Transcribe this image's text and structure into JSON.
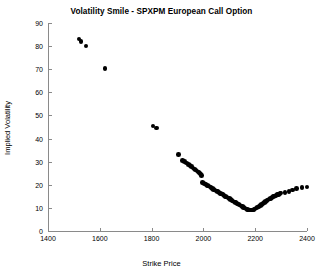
{
  "chart_data": {
    "type": "scatter",
    "title": "Volatility Smile - SPXPM European Call Option",
    "xlabel": "Strike Price",
    "ylabel": "Implied Volatility",
    "xlim": [
      1400,
      2400
    ],
    "ylim": [
      0,
      90
    ],
    "xticks": [
      1400,
      1600,
      1800,
      2000,
      2200,
      2400
    ],
    "yticks": [
      0,
      10,
      20,
      30,
      40,
      50,
      60,
      70,
      80,
      90
    ],
    "grid": false,
    "legend": null,
    "marker": {
      "shape": "circle",
      "color": "#000000",
      "size": 4.6,
      "filled": true
    },
    "series": [
      {
        "name": "Implied Volatility",
        "points": [
          [
            1520,
            83.0
          ],
          [
            1528,
            82.0
          ],
          [
            1547,
            80.0
          ],
          [
            1620,
            70.2
          ],
          [
            1805,
            45.4
          ],
          [
            1818,
            44.6
          ],
          [
            1905,
            33.0
          ],
          [
            1920,
            30.6
          ],
          [
            1928,
            30.0
          ],
          [
            1935,
            29.4
          ],
          [
            1942,
            28.8
          ],
          [
            1948,
            28.3
          ],
          [
            1954,
            27.8
          ],
          [
            1960,
            27.3
          ],
          [
            1965,
            26.9
          ],
          [
            1970,
            26.4
          ],
          [
            1975,
            26.0
          ],
          [
            1979,
            25.6
          ],
          [
            1983,
            25.2
          ],
          [
            1987,
            24.8
          ],
          [
            1990,
            24.4
          ],
          [
            1993,
            24.1
          ],
          [
            1996,
            21.0
          ],
          [
            2000,
            20.7
          ],
          [
            2005,
            20.4
          ],
          [
            2010,
            20.1
          ],
          [
            2015,
            19.7
          ],
          [
            2020,
            19.4
          ],
          [
            2025,
            19.0
          ],
          [
            2030,
            18.7
          ],
          [
            2035,
            18.3
          ],
          [
            2040,
            18.0
          ],
          [
            2045,
            17.7
          ],
          [
            2050,
            17.3
          ],
          [
            2055,
            17.0
          ],
          [
            2060,
            16.7
          ],
          [
            2065,
            16.3
          ],
          [
            2070,
            16.0
          ],
          [
            2075,
            15.7
          ],
          [
            2080,
            15.3
          ],
          [
            2085,
            15.0
          ],
          [
            2090,
            14.7
          ],
          [
            2095,
            14.3
          ],
          [
            2100,
            14.0
          ],
          [
            2105,
            13.7
          ],
          [
            2110,
            13.3
          ],
          [
            2115,
            13.0
          ],
          [
            2120,
            12.6
          ],
          [
            2125,
            12.3
          ],
          [
            2130,
            11.9
          ],
          [
            2135,
            11.6
          ],
          [
            2140,
            11.2
          ],
          [
            2145,
            10.9
          ],
          [
            2150,
            10.5
          ],
          [
            2155,
            10.2
          ],
          [
            2160,
            9.9
          ],
          [
            2165,
            9.6
          ],
          [
            2170,
            9.3
          ],
          [
            2175,
            9.1
          ],
          [
            2180,
            9.0
          ],
          [
            2185,
            9.0
          ],
          [
            2190,
            9.1
          ],
          [
            2195,
            9.3
          ],
          [
            2200,
            9.6
          ],
          [
            2205,
            9.9
          ],
          [
            2210,
            10.3
          ],
          [
            2215,
            10.7
          ],
          [
            2220,
            11.1
          ],
          [
            2225,
            11.5
          ],
          [
            2230,
            11.9
          ],
          [
            2235,
            12.3
          ],
          [
            2240,
            12.7
          ],
          [
            2245,
            13.1
          ],
          [
            2250,
            13.4
          ],
          [
            2255,
            13.8
          ],
          [
            2260,
            14.1
          ],
          [
            2265,
            14.5
          ],
          [
            2270,
            14.8
          ],
          [
            2275,
            15.1
          ],
          [
            2280,
            15.4
          ],
          [
            2285,
            15.7
          ],
          [
            2290,
            15.9
          ],
          [
            2295,
            16.2
          ],
          [
            2300,
            16.4
          ],
          [
            2315,
            16.6
          ],
          [
            2330,
            17.2
          ],
          [
            2345,
            17.8
          ],
          [
            2360,
            18.3
          ],
          [
            2380,
            18.9
          ],
          [
            2400,
            19.1
          ]
        ]
      }
    ]
  }
}
